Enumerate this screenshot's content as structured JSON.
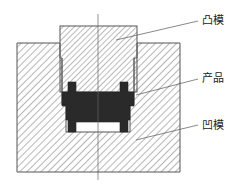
{
  "diagram": {
    "type": "mold-cross-section",
    "labels": {
      "punch": "凸模",
      "product": "产品",
      "die": "凹模"
    },
    "colors": {
      "outline": "#555555",
      "hatch": "#777777",
      "product_fill": "#2a2a2a",
      "background": "#ffffff"
    }
  }
}
